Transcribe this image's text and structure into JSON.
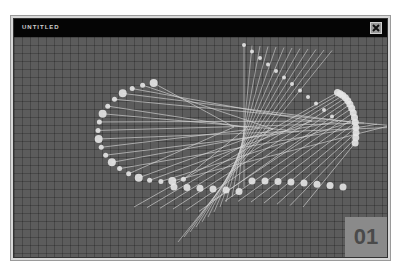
{
  "window": {
    "title": "UNTITLED",
    "close_icon": "close-x-icon"
  },
  "stage": {
    "page_number": "01",
    "colors": {
      "background": "#5c5c5c",
      "grid": "#4a4a4a",
      "lines": "#d8d8d8",
      "nodes": "#e6e6e6",
      "badge": "#8a8a8a"
    }
  }
}
